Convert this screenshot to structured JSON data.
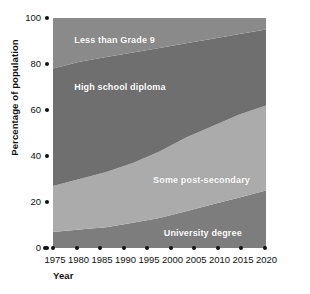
{
  "chart_data": {
    "type": "area",
    "title": "",
    "subtitle": "",
    "xlabel": "Year",
    "ylabel": "Percentage of population",
    "stacked": true,
    "normalized": true,
    "grid": false,
    "legend_position": "inline-band-labels",
    "xlim": [
      1975,
      2015
    ],
    "ylim": [
      0,
      100
    ],
    "x_tick_labels": [
      "1975",
      "1980",
      "1985",
      "1990",
      "1995",
      "2000",
      "2005",
      "2010",
      "2015",
      "2020"
    ],
    "x": [
      1975,
      1980,
      1985,
      1990,
      1995,
      2000,
      2005,
      2010,
      2015
    ],
    "y_tick_labels": [
      "100",
      "80",
      "60",
      "40",
      "20",
      "0"
    ],
    "y_ticks": [
      100,
      80,
      60,
      40,
      20,
      0
    ],
    "series": [
      {
        "name": "University degree",
        "color": "#7d7d7d",
        "values": [
          7,
          8,
          9,
          11,
          13,
          16,
          19,
          22,
          25
        ]
      },
      {
        "name": "Some post-secondary",
        "color": "#ababab",
        "values": [
          20,
          22,
          24,
          26,
          29,
          32,
          34,
          36,
          37
        ]
      },
      {
        "name": "High school diploma",
        "color": "#6f6f6f",
        "values": [
          51,
          51,
          50,
          48,
          45,
          41,
          38,
          35,
          33
        ]
      },
      {
        "name": "Less than Grade 9",
        "color": "#8a8a8a",
        "values": [
          22,
          19,
          17,
          15,
          13,
          11,
          9,
          7,
          5
        ]
      }
    ],
    "band_labels": [
      {
        "text": "Less than Grade 9",
        "x_pct": 10,
        "y_pct": 90
      },
      {
        "text": "High school diploma",
        "x_pct": 10,
        "y_pct": 69.5
      },
      {
        "text": "Some post-secondary",
        "x_pct": 47,
        "y_pct": 29
      },
      {
        "text": "University degree",
        "x_pct": 52,
        "y_pct": 6
      }
    ]
  },
  "axes": {
    "y_label": "Percentage of population",
    "x_label": "Year",
    "origin_label": "0"
  }
}
